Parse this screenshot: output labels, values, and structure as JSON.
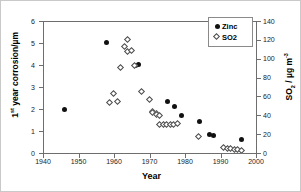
{
  "chart_data": {
    "type": "scatter",
    "title": "",
    "xlabel": "Year",
    "ylabel_left": "1st year corrosion/µm",
    "ylabel_right": "SO2 / µg m-3",
    "xlim": [
      1940,
      2000
    ],
    "ylim_left": [
      0,
      6
    ],
    "ylim_right": [
      0,
      140
    ],
    "xticks": [
      1940,
      1950,
      1960,
      1970,
      1980,
      1990,
      2000
    ],
    "yticks_left": [
      0,
      1,
      2,
      3,
      4,
      5,
      6
    ],
    "yticks_right": [
      0,
      20,
      40,
      60,
      80,
      100,
      120,
      140
    ],
    "grid": false,
    "legend_position": "top-right",
    "series": [
      {
        "name": "Zinc",
        "marker": "filled-circle",
        "axis": "left",
        "unit": "µm",
        "points": [
          {
            "x": 1946,
            "y": 2.0
          },
          {
            "x": 1958,
            "y": 5.03
          },
          {
            "x": 1966,
            "y": 4.0
          },
          {
            "x": 1967,
            "y": 4.02
          },
          {
            "x": 1975,
            "y": 2.32
          },
          {
            "x": 1977,
            "y": 2.12
          },
          {
            "x": 1979,
            "y": 1.72
          },
          {
            "x": 1984,
            "y": 1.44
          },
          {
            "x": 1987,
            "y": 0.84
          },
          {
            "x": 1988,
            "y": 0.78
          },
          {
            "x": 1996,
            "y": 0.62
          }
        ]
      },
      {
        "name": "SO2",
        "marker": "open-diamond",
        "axis": "right",
        "unit": "µg m-3",
        "points": [
          {
            "x": 1959,
            "y": 53
          },
          {
            "x": 1960,
            "y": 63
          },
          {
            "x": 1961,
            "y": 54
          },
          {
            "x": 1962,
            "y": 90
          },
          {
            "x": 1963,
            "y": 112
          },
          {
            "x": 1964,
            "y": 120
          },
          {
            "x": 1964,
            "y": 107
          },
          {
            "x": 1965,
            "y": 108
          },
          {
            "x": 1966,
            "y": 92
          },
          {
            "x": 1968,
            "y": 65
          },
          {
            "x": 1970,
            "y": 56
          },
          {
            "x": 1971,
            "y": 43
          },
          {
            "x": 1971,
            "y": 42
          },
          {
            "x": 1972,
            "y": 41
          },
          {
            "x": 1972,
            "y": 40
          },
          {
            "x": 1973,
            "y": 39
          },
          {
            "x": 1973,
            "y": 30
          },
          {
            "x": 1974,
            "y": 30
          },
          {
            "x": 1975,
            "y": 30
          },
          {
            "x": 1976,
            "y": 30
          },
          {
            "x": 1977,
            "y": 30
          },
          {
            "x": 1978,
            "y": 31
          },
          {
            "x": 1984,
            "y": 17
          },
          {
            "x": 1991,
            "y": 5
          },
          {
            "x": 1992,
            "y": 4
          },
          {
            "x": 1993,
            "y": 4
          },
          {
            "x": 1994,
            "y": 3
          },
          {
            "x": 1995,
            "y": 3
          },
          {
            "x": 1996,
            "y": 2
          }
        ]
      }
    ]
  },
  "axes": {
    "xlabel": "Year",
    "xticklabels": [
      "1940",
      "1950",
      "1960",
      "1970",
      "1980",
      "1990",
      "2000"
    ],
    "yticklabels_left": [
      "0",
      "1",
      "2",
      "3",
      "4",
      "5",
      "6"
    ],
    "yticklabels_right": [
      "0",
      "20",
      "40",
      "60",
      "80",
      "100",
      "120",
      "140"
    ],
    "ylabel_left_parts": {
      "num": "1",
      "sup": "st",
      "rest": " year corrosion/µm"
    },
    "ylabel_right_parts": {
      "base": "SO",
      "sub": "2",
      "mid": " / µg m",
      "sup": "-3"
    }
  },
  "legend": {
    "entries": [
      {
        "label": "Zinc",
        "marker": "filled-circle"
      },
      {
        "label": "SO2",
        "marker": "open-diamond"
      }
    ]
  }
}
